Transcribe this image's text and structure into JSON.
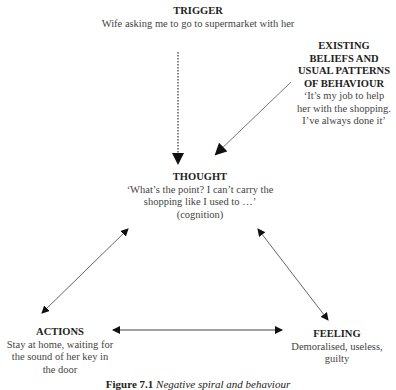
{
  "nodes": {
    "trigger": {
      "title": "TRIGGER",
      "body": "Wife asking me to go to supermarket with her"
    },
    "beliefs": {
      "title": "EXISTING BELIEFS AND USUAL PATTERNS OF BEHAVIOUR",
      "body": "‘It’s my job to help her with the shopping. I’ve always done it’"
    },
    "thought": {
      "title": "THOUGHT",
      "body": "‘What’s the point? I can’t carry the shopping like I used to …’",
      "note": "(cognition)"
    },
    "actions": {
      "title": "ACTIONS",
      "body": "Stay at home, waiting for the sound of her key in the door"
    },
    "feeling": {
      "title": "FEELING",
      "body": "Demoralised, useless, guilty"
    }
  },
  "edges": [
    {
      "from": "trigger",
      "to": "thought",
      "style": "dotted",
      "direction": "one-way"
    },
    {
      "from": "beliefs",
      "to": "thought",
      "style": "solid",
      "direction": "one-way"
    },
    {
      "from": "thought",
      "to": "actions",
      "style": "solid",
      "direction": "two-way"
    },
    {
      "from": "thought",
      "to": "feeling",
      "style": "solid",
      "direction": "two-way"
    },
    {
      "from": "actions",
      "to": "feeling",
      "style": "solid",
      "direction": "two-way"
    }
  ],
  "caption": {
    "label": "Figure 7.1",
    "text": "Negative spiral and behaviour"
  }
}
